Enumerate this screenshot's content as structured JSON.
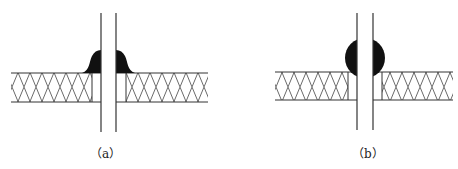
{
  "figures": [
    {
      "id": "a",
      "caption": "（a）",
      "weld_type": "fillet"
    },
    {
      "id": "b",
      "caption": "（b）",
      "weld_type": "round bead"
    }
  ],
  "colors": {
    "line": "#333333",
    "weld": "#111111",
    "background": "#ffffff"
  }
}
